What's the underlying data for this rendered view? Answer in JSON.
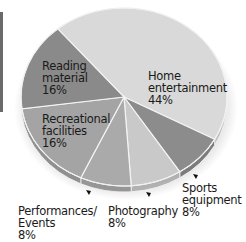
{
  "chart_data": {
    "type": "pie",
    "title": "",
    "style": "3d-tilted",
    "slices": [
      {
        "label": "Home entertainment",
        "value": 44,
        "display": "44%",
        "color": "#d9d9d9"
      },
      {
        "label": "Sports equipment",
        "value": 8,
        "display": "8%",
        "color": "#8c8c8c"
      },
      {
        "label": "Photography",
        "value": 8,
        "display": "8%",
        "color": "#c9c9c9"
      },
      {
        "label": "Performances/Events",
        "value": 8,
        "display": "8%",
        "color": "#aaaaaa"
      },
      {
        "label": "Recreational facilities",
        "value": 16,
        "display": "16%",
        "color": "#a4a4a4"
      },
      {
        "label": "Reading material",
        "value": 16,
        "display": "16%",
        "color": "#8a8a8a"
      }
    ],
    "legend": "none (inline labels)"
  },
  "labels": {
    "home": {
      "line1": "Home",
      "line2": "entertainment",
      "line3": "44%"
    },
    "reading": {
      "line1": "Reading",
      "line2": "material",
      "line3": "16%"
    },
    "recreational": {
      "line1": "Recreational",
      "line2": "facilities",
      "line3": "16%"
    },
    "sports": {
      "line1": "Sports",
      "line2": "equipment",
      "line3": "8%"
    },
    "photography": {
      "line1": "Photography",
      "line2": "8%"
    },
    "performances": {
      "line1": "Performances/",
      "line2": "Events",
      "line3": "8%"
    }
  }
}
